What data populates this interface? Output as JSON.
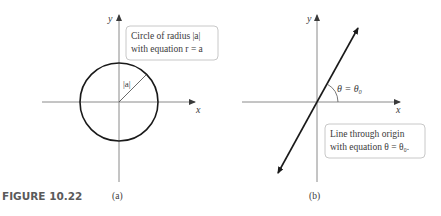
{
  "figure": {
    "label": "FIGURE 10.22"
  },
  "panel_a": {
    "sublabel": "(a)",
    "x_axis_label": "x",
    "y_axis_label": "y",
    "radius_label": "|a|",
    "callout_line1": "Circle of radius |a|",
    "callout_line2": "with equation r = a"
  },
  "panel_b": {
    "sublabel": "(b)",
    "x_axis_label": "x",
    "y_axis_label": "y",
    "angle_label": "θ = θ₀",
    "callout_line1": "Line through origin",
    "callout_line2": "with equation θ = θ₀."
  },
  "colors": {
    "axis": "#8a8a8a",
    "curve": "#1a1a1a",
    "callout_border": "#c8c8c8",
    "text": "#3a3a3a",
    "figure_label": "#5a5a5a"
  }
}
